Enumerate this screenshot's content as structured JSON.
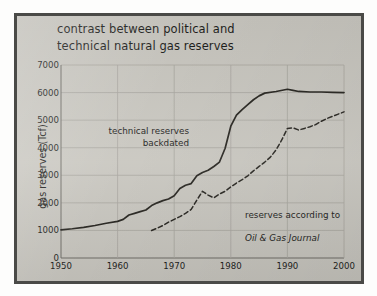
{
  "figure": {
    "title": "contrast between political and\ntechnical natural gas reserves",
    "background_color": "#c8c6bf",
    "border_color": "#4a4a47",
    "line_color": "#26241f",
    "grid_color": "#a8a69f"
  },
  "annotations": {
    "technical": "technical reserves\nbackdated",
    "oilgas_line1": "reserves according to",
    "oilgas_line2": "Oil & Gas Journal"
  },
  "chart_data": {
    "type": "line",
    "title": "contrast between political and technical natural gas reserves",
    "xlabel": "",
    "ylabel": "gas reserves (Tcf)",
    "xlim": [
      1950,
      2000
    ],
    "ylim": [
      0,
      7000
    ],
    "xticks": [
      1950,
      1960,
      1970,
      1980,
      1990,
      2000
    ],
    "yticks": [
      0,
      1000,
      2000,
      3000,
      4000,
      5000,
      6000,
      7000
    ],
    "grid": true,
    "legend": "annotations-inline",
    "series": [
      {
        "name": "technical reserves backdated",
        "style": "solid",
        "x": [
          1950,
          1952,
          1954,
          1956,
          1958,
          1960,
          1961,
          1962,
          1963,
          1964,
          1965,
          1966,
          1967,
          1968,
          1969,
          1970,
          1971,
          1972,
          1973,
          1974,
          1975,
          1976,
          1977,
          1978,
          1979,
          1980,
          1981,
          1982,
          1983,
          1984,
          1985,
          1986,
          1988,
          1990,
          1991,
          1992,
          1994,
          1996,
          1998,
          2000
        ],
        "values": [
          1020,
          1060,
          1110,
          1180,
          1260,
          1330,
          1400,
          1560,
          1620,
          1680,
          1740,
          1900,
          2000,
          2080,
          2140,
          2260,
          2520,
          2640,
          2700,
          2980,
          3100,
          3180,
          3320,
          3480,
          3980,
          4780,
          5180,
          5380,
          5560,
          5740,
          5880,
          5980,
          6040,
          6120,
          6080,
          6040,
          6020,
          6020,
          6010,
          6000
        ]
      },
      {
        "name": "reserves according to Oil & Gas Journal",
        "style": "dashed",
        "x": [
          1966,
          1967,
          1968,
          1969,
          1970,
          1971,
          1972,
          1973,
          1974,
          1975,
          1976,
          1977,
          1978,
          1979,
          1980,
          1981,
          1982,
          1983,
          1984,
          1985,
          1986,
          1987,
          1988,
          1989,
          1990,
          1991,
          1992,
          1993,
          1994,
          1995,
          1996,
          1997,
          1998,
          1999,
          2000
        ],
        "values": [
          1000,
          1080,
          1180,
          1300,
          1400,
          1500,
          1620,
          1760,
          2100,
          2420,
          2280,
          2180,
          2320,
          2420,
          2580,
          2720,
          2840,
          2980,
          3160,
          3320,
          3480,
          3660,
          3920,
          4280,
          4700,
          4720,
          4640,
          4700,
          4760,
          4840,
          4960,
          5060,
          5140,
          5220,
          5300
        ]
      }
    ]
  },
  "axes": {
    "ylabel": "gas reserves (Tcf)",
    "yticks": [
      "7000",
      "6000",
      "5000",
      "4000",
      "3000",
      "2000",
      "1000",
      "0"
    ],
    "xticks": [
      "1950",
      "1960",
      "1970",
      "1980",
      "1990",
      "2000"
    ]
  }
}
